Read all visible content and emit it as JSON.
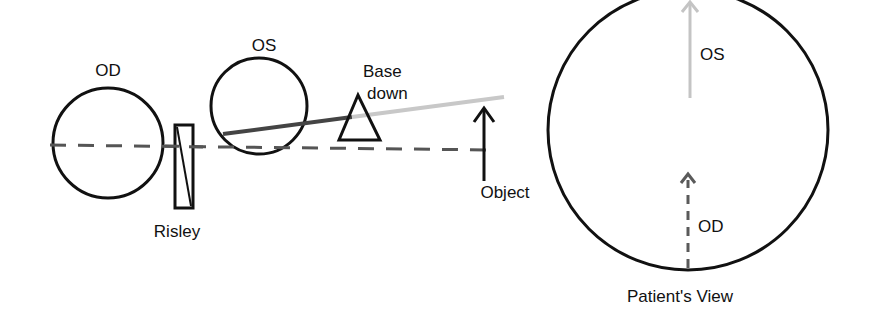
{
  "labels": {
    "od_eye": "OD",
    "os_eye": "OS",
    "prism_line1": "Base",
    "prism_line2": "down",
    "risley": "Risley",
    "object": "Object",
    "view_os": "OS",
    "view_od": "OD",
    "patients_view": "Patient's View"
  },
  "colors": {
    "stroke": "#111111",
    "dashed_line": "#555555",
    "os_ray_dark": "#444444",
    "os_ray_light": "#c8c8c8",
    "od_image_arrow": "#5a5a5a",
    "os_image_arrow": "#c4c4c4"
  }
}
